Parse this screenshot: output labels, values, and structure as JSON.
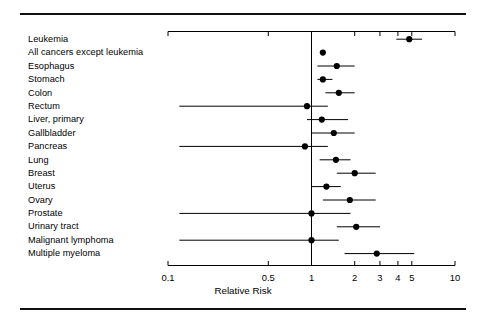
{
  "figure": {
    "axis_title": "Relative Risk",
    "line_color": "#000000",
    "marker_color": "#000000",
    "background": "#ffffff"
  },
  "chart_data": {
    "type": "scatter",
    "title": "",
    "xlabel": "Relative Risk",
    "ylabel": "",
    "xscale": "log",
    "xlim": [
      0.1,
      10
    ],
    "grid": false,
    "legend": "none",
    "reference_line": 1,
    "tick_labels": [
      "0.1",
      "0.5",
      "1",
      "2",
      "3",
      "4",
      "5",
      "10"
    ],
    "tick_values": [
      0.1,
      0.5,
      1,
      2,
      3,
      4,
      5,
      10
    ],
    "categories": [
      "Leukemia",
      "All cancers except leukemia",
      "Esophagus",
      "Stomach",
      "Colon",
      "Rectum",
      "Liver, primary",
      "Gallbladder",
      "Pancreas",
      "Lung",
      "Breast",
      "Uterus",
      "Ovary",
      "Prostate",
      "Urinary tract",
      "Malignant lymphoma",
      "Multiple myeloma"
    ],
    "values": [
      4.8,
      1.2,
      1.5,
      1.2,
      1.55,
      0.93,
      1.18,
      1.43,
      0.9,
      1.48,
      2.0,
      1.27,
      1.85,
      1.0,
      2.05,
      1.0,
      2.85
    ],
    "ci_low": [
      3.9,
      null,
      1.1,
      1.1,
      1.25,
      0.12,
      0.93,
      1.0,
      0.12,
      1.14,
      1.5,
      1.0,
      1.2,
      0.12,
      1.5,
      0.12,
      1.7
    ],
    "ci_high": [
      5.9,
      null,
      2.0,
      1.4,
      2.0,
      1.3,
      1.8,
      2.0,
      1.3,
      1.87,
      2.8,
      1.6,
      2.8,
      1.87,
      3.0,
      1.55,
      5.2
    ],
    "points": [
      {
        "label": "Leukemia",
        "rr": 4.8,
        "low": 3.9,
        "high": 5.9
      },
      {
        "label": "All cancers except leukemia",
        "rr": 1.2,
        "low": null,
        "high": null
      },
      {
        "label": "Esophagus",
        "rr": 1.5,
        "low": 1.1,
        "high": 2.0
      },
      {
        "label": "Stomach",
        "rr": 1.2,
        "low": 1.1,
        "high": 1.4
      },
      {
        "label": "Colon",
        "rr": 1.55,
        "low": 1.25,
        "high": 2.0
      },
      {
        "label": "Rectum",
        "rr": 0.93,
        "low": 0.12,
        "high": 1.3
      },
      {
        "label": "Liver, primary",
        "rr": 1.18,
        "low": 0.93,
        "high": 1.8
      },
      {
        "label": "Gallbladder",
        "rr": 1.43,
        "low": 1.0,
        "high": 2.0
      },
      {
        "label": "Pancreas",
        "rr": 0.9,
        "low": 0.12,
        "high": 1.3
      },
      {
        "label": "Lung",
        "rr": 1.48,
        "low": 1.14,
        "high": 1.87
      },
      {
        "label": "Breast",
        "rr": 2.0,
        "low": 1.5,
        "high": 2.8
      },
      {
        "label": "Uterus",
        "rr": 1.27,
        "low": 1.0,
        "high": 1.6
      },
      {
        "label": "Ovary",
        "rr": 1.85,
        "low": 1.2,
        "high": 2.8
      },
      {
        "label": "Prostate",
        "rr": 1.0,
        "low": 0.12,
        "high": 1.87
      },
      {
        "label": "Urinary tract",
        "rr": 2.05,
        "low": 1.5,
        "high": 3.0
      },
      {
        "label": "Malignant lymphoma",
        "rr": 1.0,
        "low": 0.12,
        "high": 1.55
      },
      {
        "label": "Multiple myeloma",
        "rr": 2.85,
        "low": 1.7,
        "high": 5.2
      }
    ]
  }
}
